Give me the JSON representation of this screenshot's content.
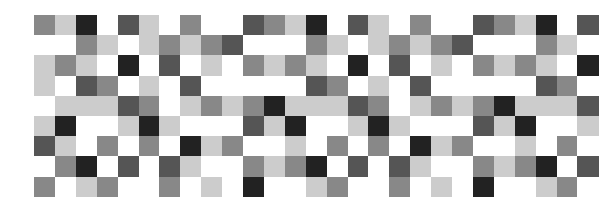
{
  "mosaic": {
    "rows": 9,
    "cols": 27,
    "palette": {
      "W": "#ffffff",
      "L": "#cccccc",
      "M": "#888888",
      "D": "#555555",
      "K": "#222222"
    },
    "grid": [
      "MLKWDLWMWWDMLKWDLWMWWDMLKWD",
      "WWMLWLMLMDWWWMLWLMLMDWWWMLW",
      "LMLWKWDWLWMLMLWKWDWLWMLMLWK",
      "LWDMWLWDWWWWWDMWLWDWWWWWDMW",
      "WLLLDMWLMLMKLLLDMWLMLMKLLLD",
      "LKWWLKLWWWDLKWWLKLWWWDLKWWL",
      "DLWMWMWKLMWWLWMWMWKLMWWLWMW",
      "WMKWDWDLWWMLMKWDWDLWWMLMKWD",
      "MWLMWWMWLWKWWLMWWMWLWKWWLMW"
    ]
  }
}
